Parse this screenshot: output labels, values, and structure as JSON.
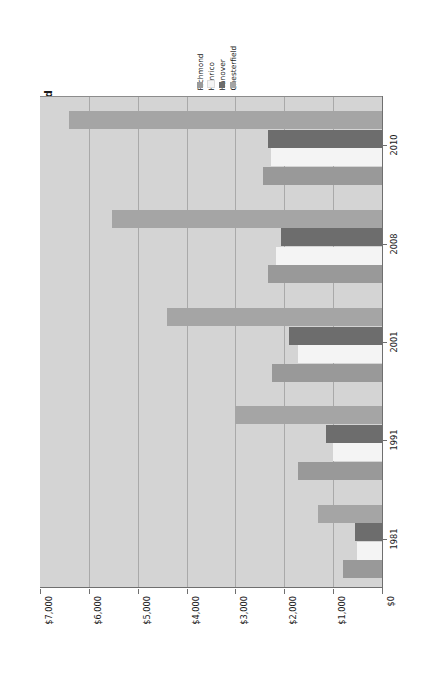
{
  "chart_data": {
    "type": "bar",
    "orientation": "horizontal",
    "title": "Local Government Debt per capita in Metropolitan Richmond",
    "xlabel": "",
    "ylabel": "",
    "categories": [
      "1981",
      "1991",
      "2001",
      "2008",
      "2010"
    ],
    "series": [
      {
        "name": "Chesterfield",
        "color": "#a5a5a5",
        "values": [
          1300,
          3000,
          4400,
          5530,
          6400
        ]
      },
      {
        "name": "Hanover",
        "color": "#6d6d6d",
        "values": [
          550,
          1150,
          1900,
          2070,
          2340
        ]
      },
      {
        "name": "Henrico",
        "color": "#f4f4f4",
        "values": [
          520,
          1000,
          1720,
          2160,
          2280
        ]
      },
      {
        "name": "Richmond",
        "color": "#999999",
        "values": [
          800,
          1720,
          2250,
          2340,
          2440
        ]
      }
    ],
    "xticks": [
      "$7,000",
      "$6,000",
      "$5,000",
      "$4,000",
      "$3,000",
      "$2,000",
      "$1,000",
      "$0"
    ],
    "xtick_values": [
      7000,
      6000,
      5000,
      4000,
      3000,
      2000,
      1000,
      0
    ],
    "xlim": [
      7000,
      0
    ],
    "x_axis_reversed": true,
    "grid": true,
    "legend_position": "top",
    "plot_background": "#d4d4d4",
    "gridline_color": "#a9a9a9",
    "axis_color": "#6f6f6f"
  },
  "legend": {
    "items": [
      {
        "label": "Chesterfield",
        "color": "#a5a5a5"
      },
      {
        "label": "Hanover",
        "color": "#6d6d6d"
      },
      {
        "label": "Henrico",
        "color": "#f4f4f4"
      },
      {
        "label": "Richmond",
        "color": "#999999"
      }
    ]
  }
}
